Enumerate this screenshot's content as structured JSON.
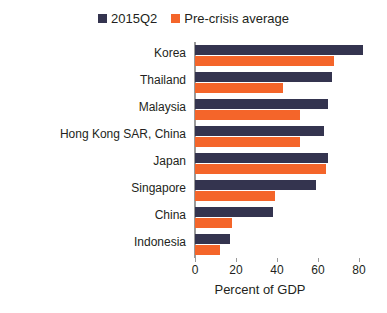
{
  "chart_data": {
    "type": "bar",
    "orientation": "horizontal",
    "title": "",
    "xlabel": "Percent of GDP",
    "ylabel": "",
    "xlim": [
      0,
      80
    ],
    "xticks": [
      0,
      20,
      40,
      60,
      80
    ],
    "grid": false,
    "legend_position": "top-center",
    "categories": [
      "Korea",
      "Thailand",
      "Malaysia",
      "Hong Kong SAR, China",
      "Japan",
      "Singapore",
      "China",
      "Indonesia"
    ],
    "series": [
      {
        "name": "2015Q2",
        "color": "#34344f",
        "values": [
          82,
          67,
          65,
          63,
          65,
          59,
          38,
          17
        ]
      },
      {
        "name": "Pre-crisis average",
        "color": "#f4652a",
        "values": [
          68,
          43,
          51,
          51,
          64,
          39,
          18,
          12
        ]
      }
    ]
  },
  "legend": {
    "entries": [
      {
        "label": "2015Q2",
        "color": "#34344f"
      },
      {
        "label": "Pre-crisis average",
        "color": "#f4652a"
      }
    ]
  },
  "axis": {
    "x_title": "Percent of GDP",
    "x_tick_labels": [
      "0",
      "20",
      "40",
      "60",
      "80"
    ]
  }
}
